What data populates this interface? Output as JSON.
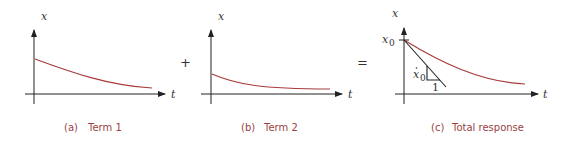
{
  "panels": [
    {
      "id": "a",
      "y_axis_label": "x",
      "x_axis_label": "t",
      "caption_letter": "(a)",
      "caption_text": "Term 1"
    },
    {
      "id": "b",
      "y_axis_label": "x",
      "x_axis_label": "t",
      "caption_letter": "(b)",
      "caption_text": "Term 2"
    },
    {
      "id": "c",
      "y_axis_label": "x",
      "x_axis_label": "t",
      "initial_value_label": "x",
      "initial_value_sub": "0",
      "slope_label": "x",
      "slope_sub": "0",
      "slope_run": "1",
      "caption_letter": "(c)",
      "caption_text": "Total response"
    }
  ],
  "operators": {
    "plus": "+",
    "equals": "="
  },
  "colors": {
    "curve": "#a83a3a",
    "caption": "#9a3f3f",
    "axis": "#222222"
  }
}
